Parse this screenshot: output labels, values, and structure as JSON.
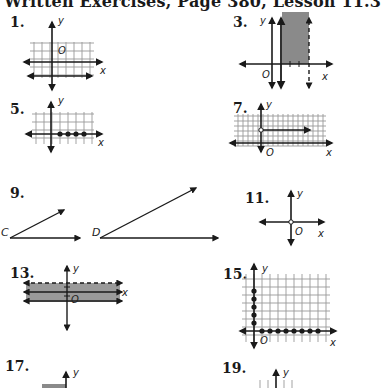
{
  "page": {
    "title": "Written Exercises, Page 380, Lesson 11.3"
  },
  "exercises": [
    {
      "number": "1.",
      "graph": "grid with two horizontal lines below origin",
      "labels": {
        "x": "x",
        "y": "y",
        "origin": "O"
      }
    },
    {
      "number": "3.",
      "graph": "shaded vertical strip between solid line and dashed line right of y-axis",
      "labels": {
        "x": "x",
        "y": "y",
        "origin": "O"
      }
    },
    {
      "number": "5.",
      "graph": "grid with four filled points on positive x-axis",
      "labels": {
        "x": "x",
        "y": "y"
      }
    },
    {
      "number": "7.",
      "graph": "dense grid with open circle and ray pointing right",
      "labels": {
        "x": "x",
        "y": "y",
        "origin": "O"
      }
    },
    {
      "number": "9.",
      "graph": "two angles",
      "labels": {
        "angle1": "C",
        "angle2": "D"
      }
    },
    {
      "number": "11.",
      "graph": "axes with open circle at origin",
      "labels": {
        "x": "x",
        "y": "y",
        "origin": "O"
      }
    },
    {
      "number": "13.",
      "graph": "shaded horizontal band between solid and dashed lines",
      "labels": {
        "x": "x",
        "y": "y",
        "origin": "O"
      }
    },
    {
      "number": "15.",
      "graph": "grid with filled points on positive y-axis and positive x-axis",
      "labels": {
        "x": "x",
        "y": "y",
        "origin": "O"
      }
    },
    {
      "number": "17.",
      "graph": "partial axes",
      "labels": {
        "y": "y"
      }
    },
    {
      "number": "19.",
      "graph": "partial axes with ticks",
      "labels": {
        "y": "y"
      }
    }
  ]
}
